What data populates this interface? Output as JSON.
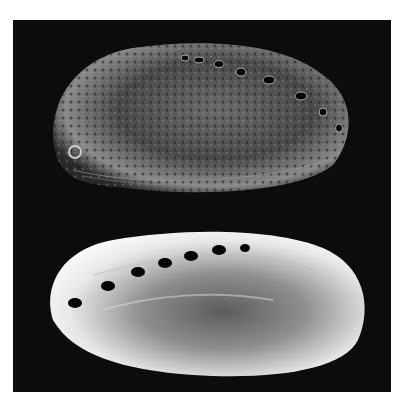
{
  "image": {
    "subject": "two abalone shells",
    "background_color": "#0c0c0c",
    "page_background": "#ffffff",
    "shells": [
      {
        "name": "top-shell",
        "view": "exterior",
        "tone": "dark mottled",
        "holes": 8
      },
      {
        "name": "bottom-shell",
        "view": "interior nacre",
        "tone": "bright pearlescent",
        "holes": 7
      }
    ]
  }
}
